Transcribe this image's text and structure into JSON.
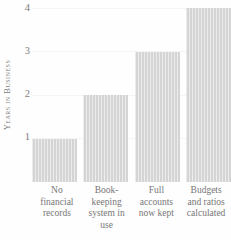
{
  "chart_data": {
    "type": "bar",
    "title": "",
    "xlabel": "",
    "ylabel": "Years in Business",
    "categories": [
      "No financial records",
      "Book-keeping system in use",
      "Full accounts now kept",
      "Budgets and ratios calculated"
    ],
    "category_lines": [
      [
        "No",
        "financial",
        "records"
      ],
      [
        "Book-",
        "keeping",
        "system in",
        "use"
      ],
      [
        "Full",
        "accounts",
        "now kept"
      ],
      [
        "Budgets",
        "and ratios",
        "calculated"
      ]
    ],
    "values": [
      1,
      2,
      3,
      4
    ],
    "ylim": [
      0,
      4
    ],
    "yticks": [
      4,
      3,
      2,
      1
    ],
    "grid": true,
    "legend": "none",
    "bar_color": "#d4d4d4",
    "text_color": "#767676",
    "background_color": "#fefefe"
  },
  "axis": {
    "y_title": "Years in Business",
    "tick_4": "4",
    "tick_3": "3",
    "tick_2": "2",
    "tick_1": "1"
  }
}
